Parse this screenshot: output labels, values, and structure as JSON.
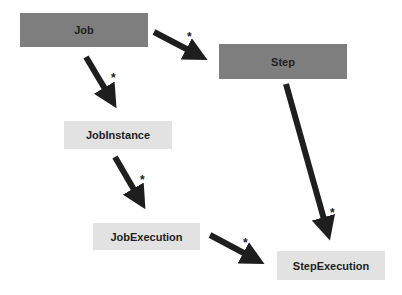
{
  "diagram": {
    "nodes": [
      {
        "id": "job",
        "label": "Job",
        "style": "dark"
      },
      {
        "id": "step",
        "label": "Step",
        "style": "dark"
      },
      {
        "id": "job_instance",
        "label": "JobInstance",
        "style": "light"
      },
      {
        "id": "job_execution",
        "label": "JobExecution",
        "style": "light"
      },
      {
        "id": "step_execution",
        "label": "StepExecution",
        "style": "light"
      }
    ],
    "edges": [
      {
        "from": "Job",
        "to": "Step",
        "multiplicity": "*"
      },
      {
        "from": "Job",
        "to": "JobInstance",
        "multiplicity": "*"
      },
      {
        "from": "JobInstance",
        "to": "JobExecution",
        "multiplicity": "*"
      },
      {
        "from": "Step",
        "to": "StepExecution",
        "multiplicity": "*"
      },
      {
        "from": "JobExecution",
        "to": "StepExecution",
        "multiplicity": "*"
      }
    ],
    "colors": {
      "dark_box": "#7e7e7e",
      "light_box": "#e2e2e2",
      "arrow": "#1e1e1e",
      "text": "#1e1e1e"
    }
  }
}
